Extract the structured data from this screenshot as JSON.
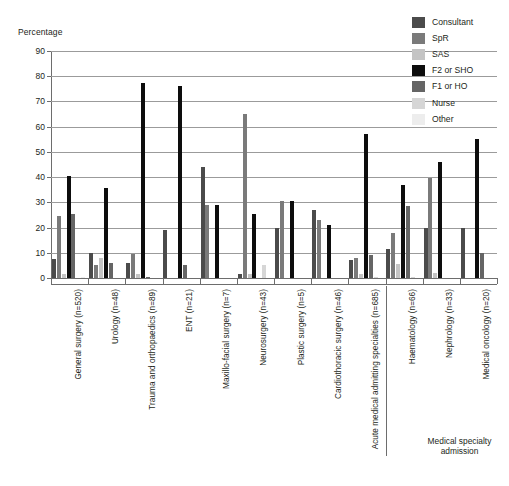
{
  "axis": {
    "y_title": "Percentage",
    "y_ticks": [
      "0",
      "10",
      "20",
      "30",
      "40",
      "50",
      "60",
      "70",
      "80",
      "90"
    ]
  },
  "annotation": {
    "bracket_note": "Medical specialty\nadmission",
    "bracket_note_line1": "Medical specialty",
    "bracket_note_line2": "admission"
  },
  "legend": {
    "items": [
      {
        "label": "Consultant",
        "color": "#4b4b4b"
      },
      {
        "label": "SpR",
        "color": "#7a7a7a"
      },
      {
        "label": "SAS",
        "color": "#c4c4c4"
      },
      {
        "label": "F2 or SHO",
        "color": "#0d0d0d"
      },
      {
        "label": "F1 or HO",
        "color": "#656565"
      },
      {
        "label": "Nurse",
        "color": "#d6d6d6"
      },
      {
        "label": "Other",
        "color": "#ededed"
      }
    ]
  },
  "chart_data": {
    "type": "bar",
    "title": "",
    "xlabel": "",
    "ylabel": "Percentage",
    "ylim": [
      0,
      90
    ],
    "grid": true,
    "legend_position": "top-right",
    "categories": [
      "General surgery (n=520)",
      "Urology (n=48)",
      "Trauma and orthopaedics (n=89)",
      "ENT (n=21)",
      "Maxillo-facial surgery (n=7)",
      "Neurosurgery (n=43)",
      "Plastic surgery (n=5)",
      "Cardiothoracic surgery (n=46)",
      "Acute medical admitting specialties (n=685)",
      "Haematology (n=66)",
      "Nephrology (n=33)",
      "Medical oncology (n=20)"
    ],
    "series": [
      {
        "name": "Consultant",
        "color": "#4b4b4b",
        "values": [
          7.5,
          10,
          6,
          19,
          44,
          1.5,
          20,
          27,
          7,
          11.5,
          20,
          20
        ]
      },
      {
        "name": "SpR",
        "color": "#7a7a7a",
        "values": [
          24.5,
          5,
          9.5,
          0,
          29,
          65,
          30.5,
          23,
          8,
          18,
          39.5,
          0
        ]
      },
      {
        "name": "SAS",
        "color": "#c4c4c4",
        "values": [
          1.5,
          8,
          1.5,
          0,
          0,
          1.5,
          0,
          0,
          1.5,
          5.5,
          2,
          0
        ]
      },
      {
        "name": "F2 or SHO",
        "color": "#0d0d0d",
        "values": [
          40.5,
          35.5,
          77.5,
          76,
          29,
          25.5,
          30.5,
          21,
          57,
          37,
          46,
          55
        ]
      },
      {
        "name": "F1 or HO",
        "color": "#656565",
        "values": [
          25.5,
          6,
          0.5,
          5,
          0,
          0,
          0,
          0,
          9,
          28.5,
          0,
          10
        ]
      },
      {
        "name": "Nurse",
        "color": "#d6d6d6",
        "values": [
          0,
          0,
          0,
          0,
          0,
          5,
          0,
          0,
          0.5,
          0.5,
          0,
          0
        ]
      },
      {
        "name": "Other",
        "color": "#ededed",
        "values": [
          0.5,
          0,
          0,
          0,
          0,
          0,
          0,
          0,
          0,
          0,
          0,
          0
        ]
      }
    ]
  }
}
